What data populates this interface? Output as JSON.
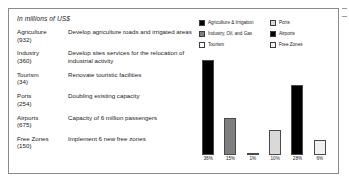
{
  "figure": {
    "units_note": "In millions of US$"
  },
  "table": {
    "rows": [
      {
        "sector": "Agriculture",
        "amount": "(932)",
        "description": "Develop agriculture roads and irrigated areas"
      },
      {
        "sector": "Industry",
        "amount": "(360)",
        "description": "Develop sites services for the relocation of industrial activity"
      },
      {
        "sector": "Tourism",
        "amount": "(34)",
        "description": "Renovate touristic facilities"
      },
      {
        "sector": "Ports",
        "amount": "(254)",
        "description": "Doubling existing capacity"
      },
      {
        "sector": "Airports",
        "amount": "(675)",
        "description": "Capacity of 6 million passengers"
      },
      {
        "sector": "Free Zones",
        "amount": "(150)",
        "description": "Implement 6 new free zones"
      }
    ]
  },
  "legend": {
    "items": [
      {
        "label": "Agriculture & Irrigation",
        "color": "#000000"
      },
      {
        "label": "Ports",
        "color": "#d9d9d9"
      },
      {
        "label": "Industry, Oil, and Gas",
        "color": "#7f7f7f"
      },
      {
        "label": "Airports",
        "color": "#000000"
      },
      {
        "label": "Tourism",
        "color": "#ffffff"
      },
      {
        "label": "Free Zones",
        "color": "#f0f0f0"
      }
    ]
  },
  "chart_data": {
    "type": "bar",
    "title": "",
    "xlabel": "",
    "ylabel": "",
    "ylim": [
      0,
      40
    ],
    "grid": false,
    "legend_position": "top",
    "categories": [
      "Agriculture & Irrigation",
      "Industry, Oil, and Gas",
      "Tourism",
      "Ports",
      "Airports",
      "Free Zones"
    ],
    "values": [
      38,
      15,
      1,
      10,
      28,
      6
    ],
    "data_labels": [
      "38%",
      "15%",
      "1%",
      "10%",
      "28%",
      "6%"
    ],
    "colors": [
      "#000000",
      "#7f7f7f",
      "#ffffff",
      "#d9d9d9",
      "#000000",
      "#f0f0f0"
    ]
  }
}
